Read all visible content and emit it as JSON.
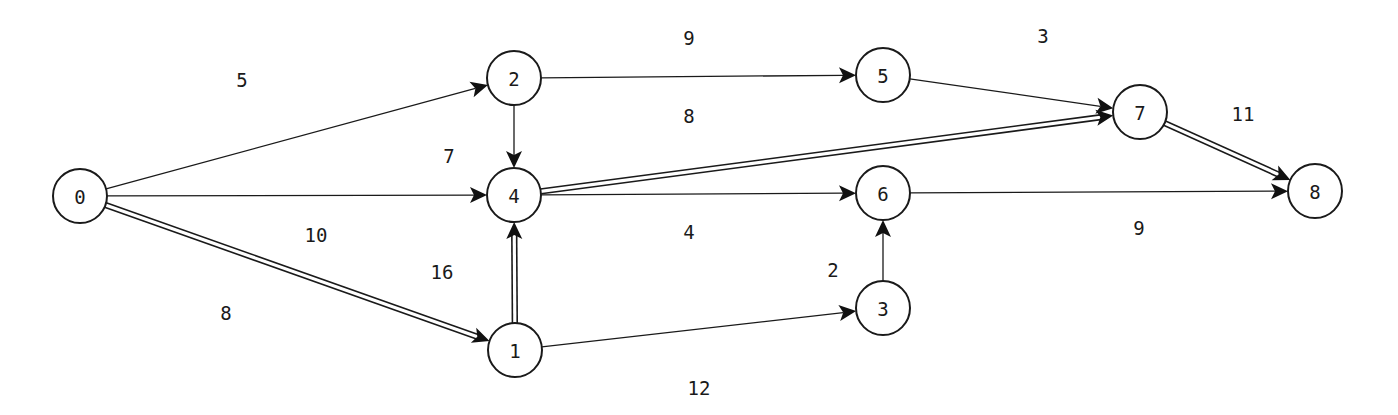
{
  "title": "",
  "graph": {
    "type": "directed-network",
    "nodes": [
      {
        "id": "0",
        "label": "0"
      },
      {
        "id": "1",
        "label": "1"
      },
      {
        "id": "2",
        "label": "2"
      },
      {
        "id": "3",
        "label": "3"
      },
      {
        "id": "4",
        "label": "4"
      },
      {
        "id": "5",
        "label": "5"
      },
      {
        "id": "6",
        "label": "6"
      },
      {
        "id": "7",
        "label": "7"
      },
      {
        "id": "8",
        "label": "8"
      }
    ],
    "edges": [
      {
        "from": "0",
        "to": "2",
        "weight": "5",
        "critical": false
      },
      {
        "from": "0",
        "to": "4",
        "weight": "10",
        "critical": false
      },
      {
        "from": "0",
        "to": "1",
        "weight": "8",
        "critical": true
      },
      {
        "from": "2",
        "to": "4",
        "weight": "7",
        "critical": false
      },
      {
        "from": "2",
        "to": "5",
        "weight": "9",
        "critical": false
      },
      {
        "from": "1",
        "to": "4",
        "weight": "16",
        "critical": true
      },
      {
        "from": "1",
        "to": "3",
        "weight": "12",
        "critical": false
      },
      {
        "from": "4",
        "to": "6",
        "weight": "4",
        "critical": false
      },
      {
        "from": "4",
        "to": "7",
        "weight": "8",
        "critical": true
      },
      {
        "from": "3",
        "to": "6",
        "weight": "2",
        "critical": false
      },
      {
        "from": "5",
        "to": "7",
        "weight": "3",
        "critical": false
      },
      {
        "from": "6",
        "to": "8",
        "weight": "9",
        "critical": false
      },
      {
        "from": "7",
        "to": "8",
        "weight": "11",
        "critical": true
      }
    ],
    "legend": {
      "critical_path_style": "double-line"
    }
  },
  "colors": {
    "ink": "#1a1a1a",
    "background": "#ffffff"
  }
}
